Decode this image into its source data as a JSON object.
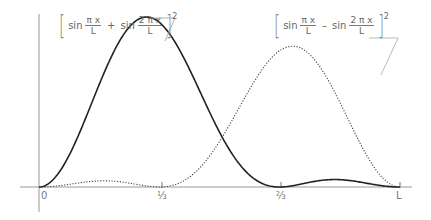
{
  "diagram": {
    "type": "wavefunction-probability-plot",
    "axes": {
      "x_ticks": [
        {
          "label": "0",
          "x": 0
        },
        {
          "label": "⅓",
          "x": 0.3333
        },
        {
          "label": "⅔",
          "x": 0.6667
        },
        {
          "label": "L",
          "x": 1
        }
      ]
    },
    "curves": [
      {
        "name": "sum-squared",
        "style": "solid",
        "color": "#222222",
        "formula": {
          "term1_fn": "sin",
          "term1_num": "π x",
          "term1_den": "L",
          "operator": "+",
          "term2_fn": "sin",
          "term2_num": "2 π x",
          "term2_den": "L",
          "exponent": "2"
        }
      },
      {
        "name": "difference-squared",
        "style": "dotted",
        "color": "#444444",
        "formula": {
          "term1_fn": "sin",
          "term1_num": "π x",
          "term1_den": "L",
          "operator": "–",
          "term2_fn": "sin",
          "term2_num": "2 π x",
          "term2_den": "L",
          "exponent": "2"
        }
      }
    ]
  }
}
